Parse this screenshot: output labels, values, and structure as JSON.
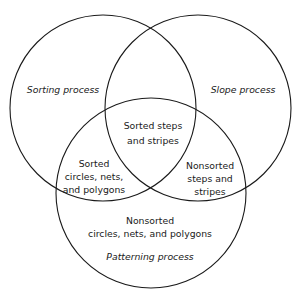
{
  "diagram": {
    "type": "venn",
    "circles": [
      {
        "id": "sorting",
        "label": "Sorting process",
        "cx": 103,
        "cy": 108,
        "r": 93
      },
      {
        "id": "slope",
        "label": "Slope process",
        "cx": 198,
        "cy": 108,
        "r": 93
      },
      {
        "id": "patterning",
        "label": "Patterning process",
        "cx": 151,
        "cy": 193,
        "r": 95
      }
    ],
    "labels": {
      "sorting_process": "Sorting process",
      "slope_process": "Slope process",
      "patterning_process": "Patterning process"
    },
    "regions": {
      "sorting_slope_patterning": {
        "line1": "Sorted steps",
        "line2": "and stripes"
      },
      "sorting_patterning": {
        "line1": "Sorted",
        "line2": "circles, nets,",
        "line3": "and polygons"
      },
      "slope_patterning": {
        "line1": "Nonsorted",
        "line2": "steps and",
        "line3": "stripes"
      },
      "patterning_only": {
        "line1": "Nonsorted",
        "line2": "circles, nets, and polygons"
      }
    },
    "stroke_color": "#1a1a1a",
    "background": "#ffffff"
  }
}
